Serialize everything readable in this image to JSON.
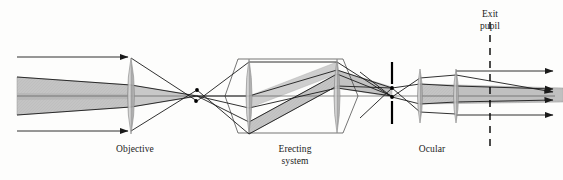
{
  "figure": {
    "width": 563,
    "height": 180,
    "background": "#fdfdfc"
  },
  "labels": {
    "objective": "Objective",
    "erecting_system": "Erecting\nsystem",
    "ocular": "Ocular",
    "exit_pupil": "Exit\npupil"
  },
  "colors": {
    "ray": "#1a1a1a",
    "axis": "#555555",
    "beam_fill": "#b9b9b9",
    "beam_fill_light": "#c9c9c9",
    "lens_fill": "#a8a8a8",
    "lens_stroke": "#8a8a8a",
    "stop": "#000000",
    "dash": "#000000"
  },
  "optics": {
    "axis_y": 96,
    "elements": [
      {
        "name": "objective-lens",
        "type": "biconvex-lens",
        "x": 131,
        "half_height": 38,
        "bulge": 7
      },
      {
        "name": "erecting-lens-1",
        "type": "biconvex-lens",
        "x": 249,
        "half_height": 37,
        "bulge": 6
      },
      {
        "name": "erecting-lens-2",
        "type": "biconvex-lens",
        "x": 337,
        "half_height": 37,
        "bulge": 6
      },
      {
        "name": "field-stop",
        "type": "aperture-stop",
        "x": 392,
        "gap_half": 10,
        "bar_length": 22
      },
      {
        "name": "ocular-lens-1",
        "type": "biconvex-lens",
        "x": 420,
        "half_height": 27,
        "bulge": 5
      },
      {
        "name": "ocular-lens-2",
        "type": "biconvex-lens",
        "x": 456,
        "half_height": 27,
        "bulge": 5
      },
      {
        "name": "exit-pupil-plane",
        "type": "dashed-line",
        "x": 490,
        "y_top": 22,
        "y_bottom": 150
      }
    ],
    "image_points": [
      {
        "name": "intermediate-image-upper",
        "x": 197,
        "y": 90
      },
      {
        "name": "intermediate-image-lower",
        "x": 196,
        "y": 101
      },
      {
        "name": "erected-image-upper",
        "x": 392,
        "y": 88
      },
      {
        "name": "erected-image-lower",
        "x": 392,
        "y": 97
      }
    ],
    "incoming_rays": [
      {
        "name": "axial-ray-top",
        "y": 57
      },
      {
        "name": "axial-ray-bottom",
        "y": 131
      }
    ],
    "outgoing_rays": [
      {
        "name": "exit-ray-1",
        "y": 71
      },
      {
        "name": "exit-ray-2",
        "y": 88
      },
      {
        "name": "exit-ray-3",
        "y": 96
      },
      {
        "name": "exit-ray-4",
        "y": 115
      }
    ]
  }
}
